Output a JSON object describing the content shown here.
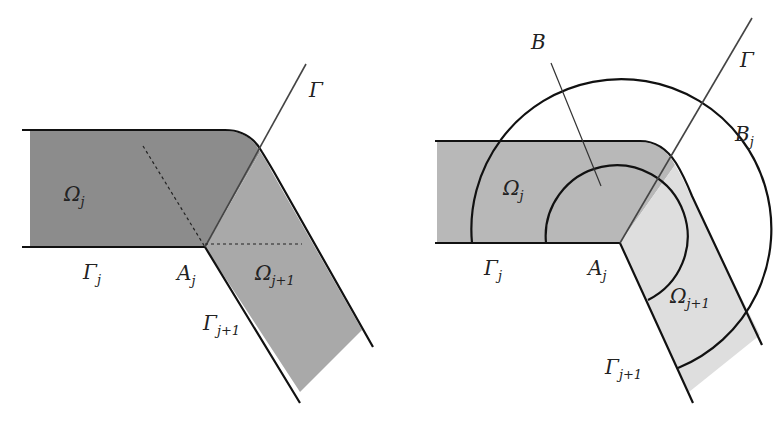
{
  "figures": [
    {
      "id": "left",
      "labels": {
        "gamma": {
          "base": "Γ",
          "sub": ""
        },
        "omega_j": {
          "base": "Ω",
          "sub": "j"
        },
        "omega_j1": {
          "base": "Ω",
          "sub": "j+1"
        },
        "gamma_j": {
          "base": "Γ",
          "sub": "j"
        },
        "a_j": {
          "base": "A",
          "sub": "j"
        },
        "gamma_j1": {
          "base": "Γ",
          "sub": "j+1"
        }
      },
      "colors": {
        "omega_j": "#8c8c8c",
        "omega_j1": "#a9a9a9",
        "stroke": "#111111"
      }
    },
    {
      "id": "right",
      "labels": {
        "b": {
          "base": "B",
          "sub": ""
        },
        "gamma": {
          "base": "Γ",
          "sub": ""
        },
        "b_j": {
          "base": "B",
          "sub": "j"
        },
        "omega_j": {
          "base": "Ω",
          "sub": "j"
        },
        "omega_j1": {
          "base": "Ω",
          "sub": "j+1"
        },
        "gamma_j": {
          "base": "Γ",
          "sub": "j"
        },
        "a_j": {
          "base": "A",
          "sub": "j"
        },
        "gamma_j1": {
          "base": "Γ",
          "sub": "j+1"
        }
      },
      "colors": {
        "omega_j": "#b8b8b8",
        "omega_j1": "#dedede",
        "stroke": "#111111"
      }
    }
  ]
}
